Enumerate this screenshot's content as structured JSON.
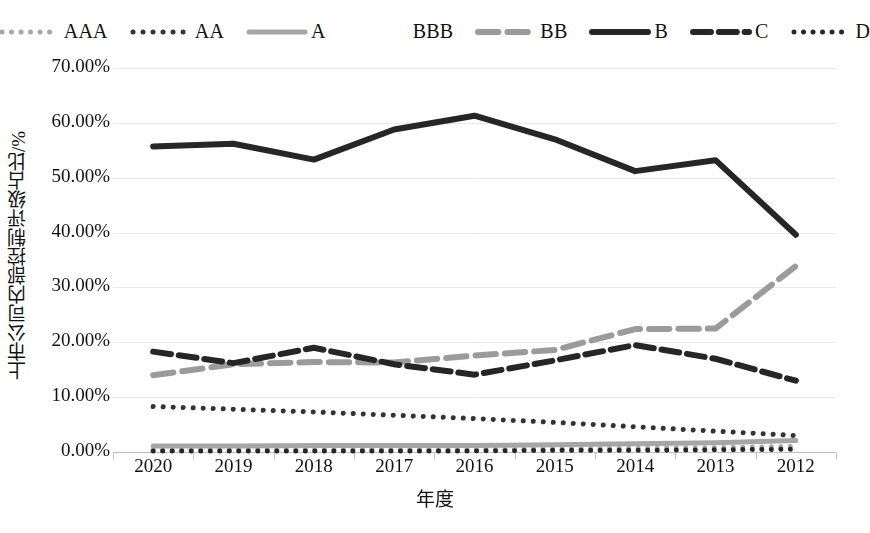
{
  "chart_data": {
    "type": "line",
    "title": "",
    "xlabel": "年度",
    "ylabel": "上市公司内部控制评级占比/%",
    "categories": [
      "2020",
      "2019",
      "2018",
      "2017",
      "2016",
      "2015",
      "2014",
      "2013",
      "2012"
    ],
    "ylim": [
      0,
      70
    ],
    "ytick_values": [
      0,
      10,
      20,
      30,
      40,
      50,
      60,
      70
    ],
    "ytick_labels": [
      "0.00%",
      "10.00%",
      "20.00%",
      "30.00%",
      "40.00%",
      "50.00%",
      "60.00%",
      "70.00%"
    ],
    "grid": true,
    "legend_position": "top",
    "series": [
      {
        "name": "AAA",
        "style": "fine-dot",
        "color": "#a6a6a6",
        "width": 5,
        "values": [
          0.4,
          0.5,
          0.5,
          0.5,
          0.5,
          0.6,
          0.7,
          0.8,
          1.0
        ]
      },
      {
        "name": "AA",
        "style": "round-dot",
        "color": "#333333",
        "width": 5,
        "values": [
          8.3,
          7.8,
          7.3,
          6.7,
          6.1,
          5.4,
          4.6,
          3.8,
          3.0
        ]
      },
      {
        "name": "A",
        "style": "solid",
        "color": "#a6a6a6",
        "width": 5,
        "values": [
          1.1,
          1.1,
          1.2,
          1.2,
          1.2,
          1.3,
          1.5,
          1.7,
          2.1
        ]
      },
      {
        "name": "BBB",
        "style": "square-dot",
        "color": "#333333",
        "width": 5,
        "values": [
          2.3,
          2.5,
          2.7,
          2.8,
          2.9,
          3.2,
          3.6,
          4.3,
          5.5
        ]
      },
      {
        "name": "BB",
        "style": "dash",
        "color": "#9b9b9b",
        "width": 6,
        "values": [
          14.0,
          16.0,
          16.4,
          16.3,
          17.6,
          18.6,
          22.4,
          22.5,
          33.9
        ]
      },
      {
        "name": "B",
        "style": "solid",
        "color": "#262626",
        "width": 6,
        "values": [
          55.7,
          56.2,
          53.3,
          58.8,
          61.3,
          57.0,
          51.2,
          53.2,
          39.6
        ]
      },
      {
        "name": "C",
        "style": "long-dash",
        "color": "#262626",
        "width": 6,
        "values": [
          18.3,
          16.2,
          19.0,
          16.0,
          14.1,
          16.7,
          19.5,
          17.0,
          13.0
        ]
      },
      {
        "name": "D",
        "style": "dot",
        "color": "#262626",
        "width": 5,
        "values": [
          0.2,
          0.2,
          0.2,
          0.2,
          0.2,
          0.3,
          0.3,
          0.4,
          0.5
        ]
      }
    ]
  },
  "legend": {
    "items": [
      {
        "label": "AAA"
      },
      {
        "label": "AA"
      },
      {
        "label": "A"
      },
      {
        "label": "BBB"
      },
      {
        "label": "BB"
      },
      {
        "label": "B"
      },
      {
        "label": "C"
      },
      {
        "label": "D"
      }
    ]
  },
  "axes": {
    "y_title": "上市公司内部控制评级占比/%",
    "x_title": "年度"
  },
  "colors": {
    "background": "#ffffff",
    "grid": "#e8e8e8",
    "axis": "#bfbfbf",
    "dark_line": "#262626",
    "gray_line": "#a6a6a6"
  }
}
